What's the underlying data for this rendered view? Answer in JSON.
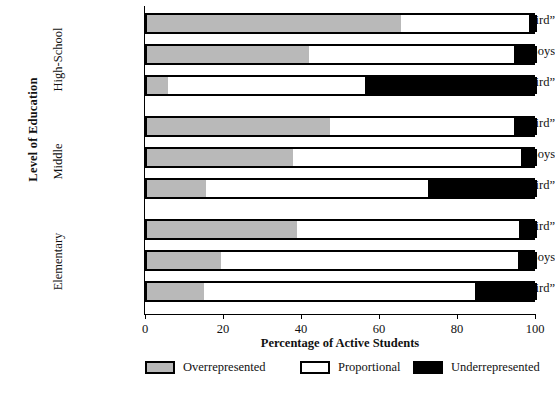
{
  "chart_data": {
    "type": "bar",
    "orientation": "horizontal",
    "stacked": true,
    "title": "",
    "xlabel": "Percentage of Active Students",
    "ylabel": "Level of Education",
    "xlim": [
      0,
      100
    ],
    "xticks": [
      0,
      20,
      40,
      60,
      80,
      100
    ],
    "xtick_labels": [
      "0",
      "20",
      "40",
      "60",
      "80",
      "100"
    ],
    "grid": false,
    "legend_position": "bottom",
    "series": [
      {
        "name": "Overrepresented",
        "color": "#b9b9b9",
        "values": [
          65,
          41.5,
          5.5,
          47,
          37.5,
          15,
          38.5,
          19,
          14.5
        ]
      },
      {
        "name": "Proportional",
        "color": "#ffffff",
        "values": [
          33,
          52.5,
          50.5,
          47,
          58.5,
          57,
          57,
          76,
          69.5
        ]
      },
      {
        "name": "Underrepresented",
        "color": "#000000",
        "values": [
          2,
          6,
          44,
          6,
          4,
          28,
          4.5,
          5,
          16
        ]
      }
    ],
    "categories": [
      "“Top Third”",
      "Boys",
      "“Bottom Third”",
      "“Top Third”",
      "Boys",
      "“Bottom Third”",
      "“Top Third”",
      "Boys",
      "“Bottom Third”"
    ],
    "groups": [
      {
        "label": "High-School",
        "categories": [
          "“Top Third”",
          "Boys",
          "“Bottom Third”"
        ]
      },
      {
        "label": "Middle",
        "categories": [
          "“Top Third”",
          "Boys",
          "“Bottom Third”"
        ]
      },
      {
        "label": "Elementary",
        "categories": [
          "“Top Third”",
          "Boys",
          "“Bottom Third”"
        ]
      }
    ],
    "bars": [
      {
        "group": "High-School",
        "category": "“Top Third”",
        "over": 65,
        "prop": 33,
        "under": 2
      },
      {
        "group": "High-School",
        "category": "Boys",
        "over": 41.5,
        "prop": 52.5,
        "under": 6
      },
      {
        "group": "High-School",
        "category": "“Bottom Third”",
        "over": 5.5,
        "prop": 50.5,
        "under": 44
      },
      {
        "group": "Middle",
        "category": "“Top Third”",
        "over": 47,
        "prop": 47,
        "under": 6
      },
      {
        "group": "Middle",
        "category": "Boys",
        "over": 37.5,
        "prop": 58.5,
        "under": 4
      },
      {
        "group": "Middle",
        "category": "“Bottom Third”",
        "over": 15,
        "prop": 57,
        "under": 28
      },
      {
        "group": "Elementary",
        "category": "“Top Third”",
        "over": 38.5,
        "prop": 57,
        "under": 4.5
      },
      {
        "group": "Elementary",
        "category": "Boys",
        "over": 19,
        "prop": 76,
        "under": 5
      },
      {
        "group": "Elementary",
        "category": "“Bottom Third”",
        "over": 14.5,
        "prop": 69.5,
        "under": 16
      }
    ]
  },
  "axes": {
    "y_title": "Level of Education",
    "x_title": "Percentage of Active Students",
    "x_ticks": [
      "0",
      "20",
      "40",
      "60",
      "80",
      "100"
    ]
  },
  "groups": {
    "highschool": "High-School",
    "middle": "Middle",
    "elementary": "Elementary"
  },
  "categories": {
    "top": "“Top Third”",
    "boys": "Boys",
    "bottom": "“Bottom Third”"
  },
  "legend": {
    "items": [
      {
        "label": "Overrepresented",
        "color": "#b9b9b9"
      },
      {
        "label": "Proportional",
        "color": "#ffffff"
      },
      {
        "label": "Underrepresented",
        "color": "#000000"
      }
    ]
  },
  "colors": {
    "overrepresented": "#b9b9b9",
    "proportional": "#ffffff",
    "underrepresented": "#000000",
    "axis": "#000000",
    "background": "#ffffff"
  }
}
